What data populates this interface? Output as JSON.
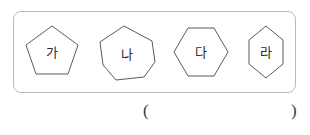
{
  "worksheet": {
    "name": "polygon-identification-figure",
    "figure_box": {
      "border_color": "#b9b9b9",
      "background": "#ffffff"
    },
    "shapes": [
      {
        "id": "ga",
        "label": "가",
        "shape_type": "pentagon",
        "sides": 5,
        "description": "regular pentagon"
      },
      {
        "id": "na",
        "label": "나",
        "shape_type": "heptagon",
        "sides": 7,
        "description": "irregular heptagon"
      },
      {
        "id": "da",
        "label": "다",
        "shape_type": "hexagon",
        "sides": 6,
        "description": "regular wide hexagon"
      },
      {
        "id": "ra",
        "label": "라",
        "shape_type": "hexagon",
        "sides": 6,
        "description": "narrow tall hexagon"
      }
    ],
    "answer": {
      "open_paren": "(",
      "close_paren": ")",
      "value": ""
    },
    "colors": {
      "shape_stroke": "#5a5a5a",
      "box_stroke": "#b9b9b9",
      "text": "#2b2b2b",
      "page_background": "#ffffff"
    }
  }
}
